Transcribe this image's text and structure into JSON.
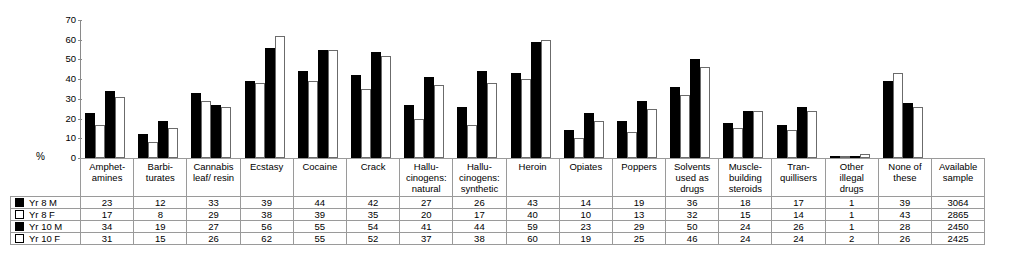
{
  "axis": {
    "y_unit_label": "%",
    "y_ticks": [
      "70",
      "60",
      "50",
      "40",
      "30",
      "20",
      "10",
      "0"
    ]
  },
  "series_legend": [
    {
      "label": "Yr 8 M",
      "marker": "filled-square-icon"
    },
    {
      "label": "Yr 8 F",
      "marker": "open-square-icon"
    },
    {
      "label": "Yr 10 M",
      "marker": "filled-square-icon"
    },
    {
      "label": "Yr 10 F",
      "marker": "open-square-icon"
    }
  ],
  "categories": [
    {
      "lines": [
        "Amphet-",
        "amines"
      ]
    },
    {
      "lines": [
        "Barbi-",
        "turates"
      ]
    },
    {
      "lines": [
        "Cannabis",
        "leaf/ resin"
      ]
    },
    {
      "lines": [
        "Ecstasy"
      ]
    },
    {
      "lines": [
        "Cocaine"
      ]
    },
    {
      "lines": [
        "Crack"
      ]
    },
    {
      "lines": [
        "Hallu-",
        "cinogens:",
        "natural"
      ]
    },
    {
      "lines": [
        "Hallu-",
        "cinogens:",
        "synthetic"
      ]
    },
    {
      "lines": [
        "Heroin"
      ]
    },
    {
      "lines": [
        "Opiates"
      ]
    },
    {
      "lines": [
        "Poppers"
      ]
    },
    {
      "lines": [
        "Solvents",
        "used as drugs"
      ]
    },
    {
      "lines": [
        "Muscle-",
        "building",
        "steroids"
      ]
    },
    {
      "lines": [
        "Tran-",
        "quillisers"
      ]
    },
    {
      "lines": [
        "Other",
        "illegal drugs"
      ]
    },
    {
      "lines": [
        "None of these"
      ]
    },
    {
      "lines": [
        "Available",
        "sample"
      ]
    }
  ],
  "table_rows": [
    {
      "label": "Yr 8 M",
      "values": [
        "23",
        "12",
        "33",
        "39",
        "44",
        "42",
        "27",
        "26",
        "43",
        "14",
        "19",
        "36",
        "18",
        "17",
        "1",
        "39",
        "3064"
      ]
    },
    {
      "label": "Yr 8 F",
      "values": [
        "17",
        "8",
        "29",
        "38",
        "39",
        "35",
        "20",
        "17",
        "40",
        "10",
        "13",
        "32",
        "15",
        "14",
        "1",
        "43",
        "2865"
      ]
    },
    {
      "label": "Yr 10 M",
      "values": [
        "34",
        "19",
        "27",
        "56",
        "55",
        "54",
        "41",
        "44",
        "59",
        "23",
        "29",
        "50",
        "24",
        "26",
        "1",
        "28",
        "2450"
      ]
    },
    {
      "label": "Yr 10 F",
      "values": [
        "31",
        "15",
        "26",
        "62",
        "55",
        "52",
        "37",
        "38",
        "60",
        "19",
        "25",
        "46",
        "24",
        "24",
        "2",
        "26",
        "2425"
      ]
    }
  ],
  "colors": {
    "male_bar": "#000000",
    "female_bar": "#ffffff",
    "bar_outline": "#6b6b6b",
    "grid_line": "#9a9a9a",
    "background": "#ffffff"
  },
  "chart_data": {
    "type": "bar",
    "title": "",
    "subtitle": "",
    "xlabel": "",
    "ylabel": "%",
    "ylim": [
      0,
      70
    ],
    "ytick_step": 10,
    "grid": false,
    "legend_position": "bottom-table",
    "categories": [
      "Amphetamines",
      "Barbiturates",
      "Cannabis leaf/ resin",
      "Ecstasy",
      "Cocaine",
      "Crack",
      "Hallucinogens: natural",
      "Hallucinogens: synthetic",
      "Heroin",
      "Opiates",
      "Poppers",
      "Solvents used as drugs",
      "Muscle-building steroids",
      "Tranquillisers",
      "Other illegal drugs",
      "None of these",
      "Available sample"
    ],
    "series": [
      {
        "name": "Yr 8 M",
        "values": [
          23,
          12,
          33,
          39,
          44,
          42,
          27,
          26,
          43,
          14,
          19,
          36,
          18,
          17,
          1,
          39,
          null
        ]
      },
      {
        "name": "Yr 8 F",
        "values": [
          17,
          8,
          29,
          38,
          39,
          35,
          20,
          17,
          40,
          10,
          13,
          32,
          15,
          14,
          1,
          43,
          null
        ]
      },
      {
        "name": "Yr 10 M",
        "values": [
          34,
          19,
          27,
          56,
          55,
          54,
          41,
          44,
          59,
          23,
          29,
          50,
          24,
          26,
          1,
          28,
          null
        ]
      },
      {
        "name": "Yr 10 F",
        "values": [
          31,
          15,
          26,
          62,
          55,
          52,
          37,
          38,
          60,
          19,
          25,
          46,
          24,
          24,
          2,
          26,
          null
        ]
      }
    ],
    "available_sample": {
      "Yr 8 M": 3064,
      "Yr 8 F": 2865,
      "Yr 10 M": 2450,
      "Yr 10 F": 2425
    }
  }
}
